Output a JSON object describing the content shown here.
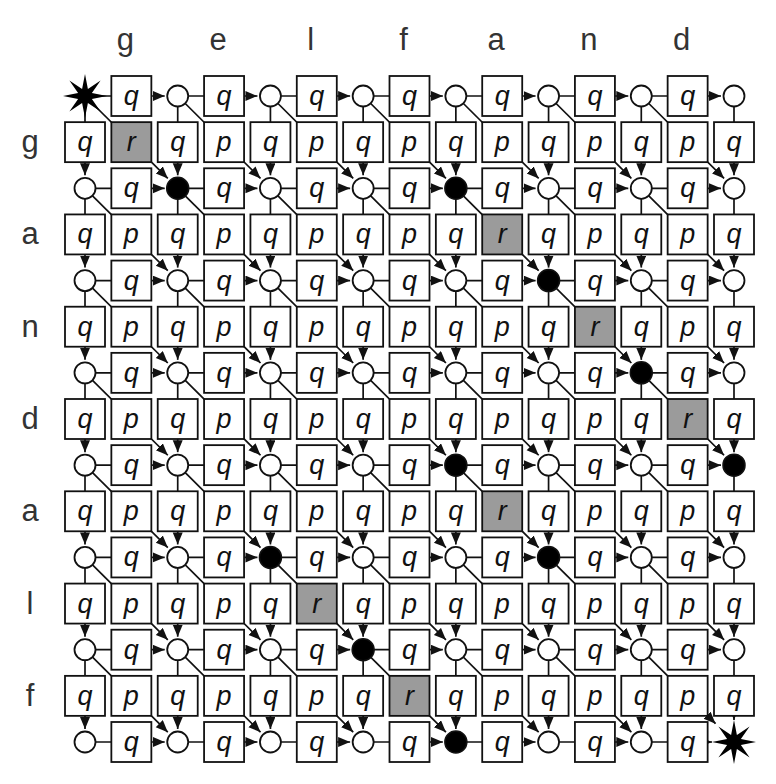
{
  "figure": {
    "columns": [
      "g",
      "e",
      "l",
      "f",
      "a",
      "n",
      "d"
    ],
    "rows": [
      "g",
      "a",
      "n",
      "d",
      "a",
      "l",
      "f"
    ],
    "edge_labels": {
      "gap": "q",
      "mismatch": "p",
      "match": "r"
    },
    "match_cells": [
      [
        1,
        1
      ],
      [
        2,
        5
      ],
      [
        3,
        6
      ],
      [
        4,
        7
      ],
      [
        5,
        5
      ],
      [
        6,
        3
      ],
      [
        7,
        4
      ]
    ],
    "path_nodes": [
      [
        1,
        1
      ],
      [
        1,
        4
      ],
      [
        2,
        5
      ],
      [
        3,
        6
      ],
      [
        4,
        4
      ],
      [
        4,
        7
      ],
      [
        5,
        2
      ],
      [
        5,
        5
      ],
      [
        6,
        3
      ],
      [
        7,
        4
      ]
    ],
    "start_node": [
      0,
      0
    ],
    "end_node": [
      7,
      7
    ],
    "grid": {
      "node_rows": 8,
      "node_cols": 8
    },
    "colors": {
      "line": "#111111",
      "box_stroke": "#111111",
      "box_fill": "#ffffff",
      "match_fill": "#9b9b9b",
      "node_fill": "#ffffff",
      "path_node_fill": "#000000",
      "star_fill": "#000000",
      "letter": "#333333",
      "cost_text": "#111111",
      "background": "#ffffff"
    }
  }
}
